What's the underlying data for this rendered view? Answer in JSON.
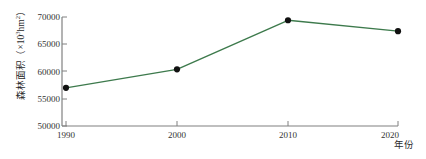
{
  "chart_data": {
    "type": "line",
    "title": "",
    "xlabel": "年份",
    "ylabel": "森林面积（×10³hm²）",
    "ylabel_parts": {
      "name": "森林面积（×10",
      "exponent": "3",
      "unit": "hm",
      "unit_exponent": "2",
      "close": "）"
    },
    "categories": [
      "1990",
      "2000",
      "2010",
      "2020"
    ],
    "x": [
      1990,
      2000,
      2010,
      2020
    ],
    "values": [
      57000,
      60400,
      69400,
      67400
    ],
    "series": [
      {
        "name": "森林面积",
        "values": [
          57000,
          60400,
          69400,
          67400
        ]
      }
    ],
    "ylim": [
      50000,
      70000
    ],
    "yticks": [
      "50000",
      "55000",
      "60000",
      "65000",
      "70000"
    ],
    "ytick_values": [
      50000,
      55000,
      60000,
      65000,
      70000
    ],
    "xticks": [
      "1990",
      "2000",
      "2010",
      "2020"
    ],
    "grid": false,
    "legend": "none",
    "line_color": "#3d7a4c",
    "marker_color": "#111111",
    "axis_color": "#808080",
    "marker": "circle",
    "annotations": []
  },
  "figure": {
    "background": "#ffffff",
    "axis_line_color": "#808080",
    "tick_label_color": "#333333"
  }
}
